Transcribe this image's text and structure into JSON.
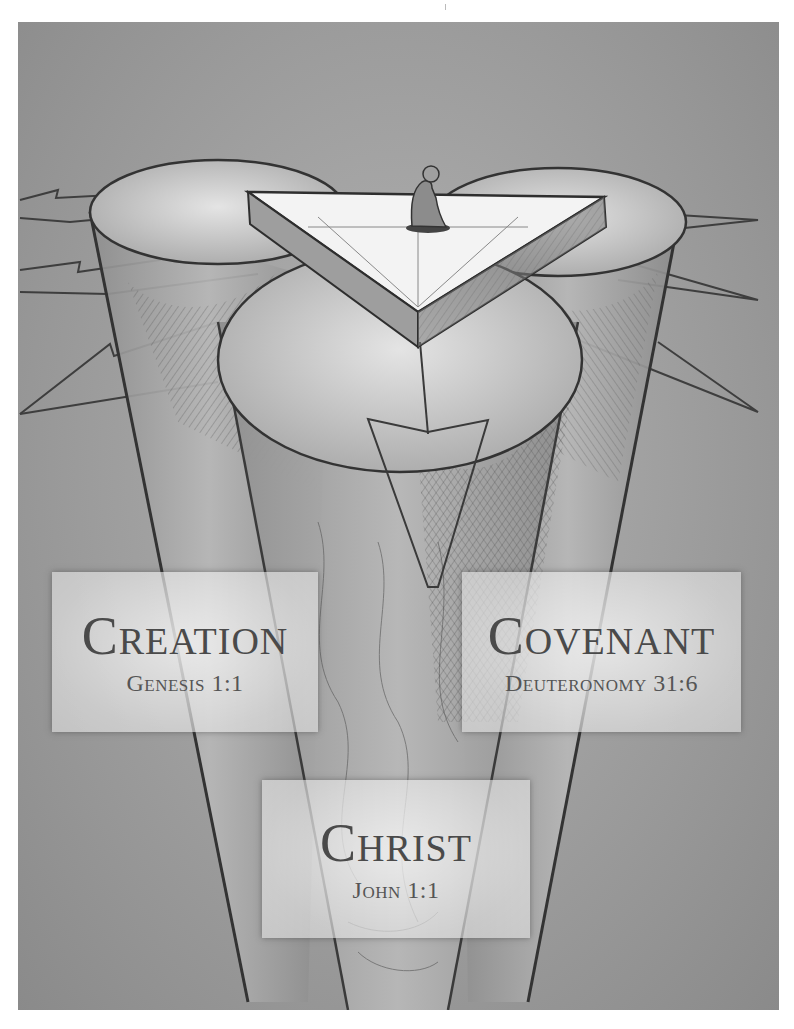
{
  "illustration": {
    "description": "Pencil sketch of a kneeling figure atop a triangular platform resting on three converging cylinders with arrows",
    "figure": "kneeling-person",
    "colors": {
      "background": "#9d9d9d",
      "platform_top": "#f2f2f2",
      "line": "#3a3a3a"
    }
  },
  "labels": {
    "creation": {
      "title": "Creation",
      "reference": "Genesis 1:1"
    },
    "covenant": {
      "title": "Covenant",
      "reference": "Deuteronomy 31:6"
    },
    "christ": {
      "title": "Christ",
      "reference": "John 1:1"
    }
  }
}
